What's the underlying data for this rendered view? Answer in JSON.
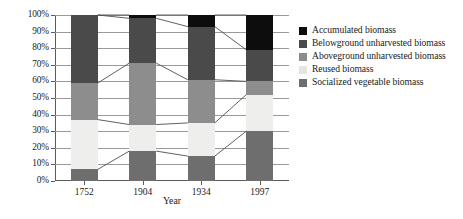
{
  "chart_data": {
    "type": "bar",
    "subtype": "stacked-100-percent",
    "title": "",
    "xlabel": "Year",
    "ylabel": "",
    "categories": [
      "1752",
      "1904",
      "1934",
      "1997"
    ],
    "ylim": [
      0,
      100
    ],
    "ytick_labels": [
      "0%",
      "10%",
      "20%",
      "30%",
      "40%",
      "50%",
      "60%",
      "70%",
      "80%",
      "90%",
      "100%"
    ],
    "ytick_values": [
      0,
      10,
      20,
      30,
      40,
      50,
      60,
      70,
      80,
      90,
      100
    ],
    "grid": true,
    "legend_position": "right",
    "connector_lines": true,
    "series": [
      {
        "name": "Socialized vegetable biomass",
        "color": "#6e6e6e",
        "values": [
          7,
          18,
          15,
          30
        ]
      },
      {
        "name": "Reused biomass",
        "color": "#eeeeec",
        "values": [
          30,
          16,
          20,
          22
        ]
      },
      {
        "name": "Aboveground unharvested biomass",
        "color": "#8d8d8d",
        "values": [
          22,
          37,
          26,
          8
        ]
      },
      {
        "name": "Belowground unharvested biomass",
        "color": "#4a4a4a",
        "values": [
          41,
          27,
          32,
          19
        ]
      },
      {
        "name": "Accumulated biomass",
        "color": "#0d0d0d",
        "values": [
          0,
          2,
          7,
          21
        ]
      }
    ],
    "stack_order_bottom_to_top": [
      "Socialized vegetable biomass",
      "Reused biomass",
      "Aboveground unharvested biomass",
      "Belowground unharvested biomass",
      "Accumulated biomass"
    ],
    "cumulative_boundaries": {
      "1752": [
        0,
        7,
        37,
        59,
        100,
        100
      ],
      "1904": [
        0,
        18,
        34,
        71,
        98,
        100
      ],
      "1934": [
        0,
        15,
        35,
        61,
        93,
        100
      ],
      "1997": [
        0,
        30,
        52,
        60,
        79,
        100
      ]
    }
  },
  "legend": {
    "items": [
      {
        "label": "Accumulated biomass",
        "color": "#0d0d0d"
      },
      {
        "label": "Belowground unharvested biomass",
        "color": "#4a4a4a"
      },
      {
        "label": "Aboveground unharvested biomass",
        "color": "#8d8d8d"
      },
      {
        "label": "Reused biomass",
        "color": "#e4e4e1"
      },
      {
        "label": "Socialized vegetable biomass",
        "color": "#6e6e6e"
      }
    ]
  },
  "axes": {
    "x_title": "Year",
    "gridline_color": "#9a9a9a",
    "axis_color": "#5a5a5a"
  }
}
